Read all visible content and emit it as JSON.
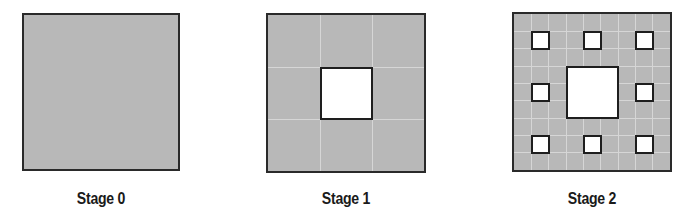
{
  "figure": {
    "type": "sierpinski-carpet-stages",
    "colors": {
      "fill": "#b8b8b8",
      "border": "#2a2a2a",
      "hole": "#ffffff",
      "grid": "#d6d6d6"
    },
    "stages": [
      {
        "label": "Stage 0",
        "x": 22,
        "y": 13,
        "size": 158,
        "grid_divisions": 0,
        "holes": []
      },
      {
        "label": "Stage 1",
        "x": 266,
        "y": 13,
        "size": 160,
        "grid_divisions": 3,
        "holes": [
          {
            "row": 1,
            "col": 1,
            "span": 1,
            "of": 3
          }
        ]
      },
      {
        "label": "Stage 2",
        "x": 512,
        "y": 12,
        "size": 160,
        "grid_divisions": 9,
        "holes": [
          {
            "row": 1,
            "col": 1,
            "of": 9
          },
          {
            "row": 1,
            "col": 4,
            "of": 9
          },
          {
            "row": 1,
            "col": 7,
            "of": 9
          },
          {
            "row": 4,
            "col": 1,
            "of": 9
          },
          {
            "row": 3,
            "col": 3,
            "span": 3,
            "of": 9
          },
          {
            "row": 4,
            "col": 7,
            "of": 9
          },
          {
            "row": 7,
            "col": 1,
            "of": 9
          },
          {
            "row": 7,
            "col": 4,
            "of": 9
          },
          {
            "row": 7,
            "col": 7,
            "of": 9
          }
        ]
      }
    ]
  }
}
